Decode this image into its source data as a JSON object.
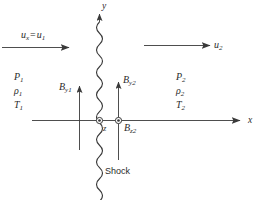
{
  "figure": {
    "background_color": "#ffffff",
    "line_color": "#3a3a3a",
    "text_color": "#2b2b2b",
    "width": 262,
    "height": 200
  },
  "axes": {
    "x_label": "x",
    "y_label": "y",
    "z_label": "z",
    "origin_marker": "circled-dot"
  },
  "upstream": {
    "velocity_label_prefix": "u",
    "velocity_label_sub1": "x",
    "velocity_label_op": "=",
    "velocity_label_base": "u",
    "velocity_label_sub2": "1",
    "pressure": "P",
    "pressure_sub": "1",
    "density": "ρ",
    "density_sub": "1",
    "temperature": "T",
    "temperature_sub": "1",
    "magnetic_y": "B",
    "magnetic_y_sub": "y1"
  },
  "downstream": {
    "velocity": "u",
    "velocity_sub": "2",
    "pressure": "P",
    "pressure_sub": "2",
    "density": "ρ",
    "density_sub": "2",
    "temperature": "T",
    "temperature_sub": "2",
    "magnetic_y": "B",
    "magnetic_y_sub": "y2",
    "magnetic_z": "B",
    "magnetic_z_sub": "z2"
  },
  "shock": {
    "label": "Shock",
    "style": "wavy-vertical-line"
  },
  "icons": {
    "arrow_right": "arrow-right-icon",
    "arrow_up": "arrow-up-icon",
    "circled_dot": "circled-dot-icon"
  }
}
